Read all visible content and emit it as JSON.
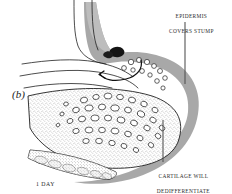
{
  "figure": {
    "panel_label": "(b)",
    "time_caption": "1 DAY",
    "annotations": [
      {
        "id": "epidermis",
        "line1": "EPIDERMIS",
        "line2": "COVERS STUMP"
      },
      {
        "id": "cartilage",
        "line1": "CARTILAGE WILL",
        "line2": "DEDIFFERENTIATE"
      }
    ],
    "icons": {
      "migration_arrow": "curved-arrow-icon",
      "wound_clot": "dark-blob-icon"
    },
    "colors": {
      "background": "#ffffff",
      "epidermis_gray": "#a8a8a8",
      "epidermis_gray_light": "#bdbdbd",
      "outline": "#1f1f1f",
      "stipple": "#6e6e6e",
      "clot_dark": "#141414",
      "leader_line": "#555555",
      "text": "#2b2b2b"
    }
  }
}
